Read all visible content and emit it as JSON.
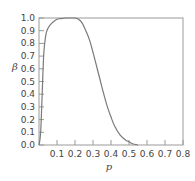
{
  "chart_data": {
    "type": "line",
    "title": "",
    "xlabel": "p",
    "ylabel": "β",
    "xlim": [
      0,
      0.8
    ],
    "ylim": [
      0,
      1.0
    ],
    "xticks": [
      "0.1",
      "0.2",
      "0.3",
      "0.4",
      "0.5",
      "0.6",
      "0.7",
      "0.8"
    ],
    "yticks": [
      "0.0",
      "0.1",
      "0.2",
      "0.3",
      "0.4",
      "0.5",
      "0.6",
      "0.7",
      "0.8",
      "0.9",
      "1.0"
    ],
    "grid": false,
    "legend": null,
    "series": [
      {
        "name": "β(p)",
        "color": "#7a7a7a",
        "x": [
          0.0,
          0.005,
          0.01,
          0.015,
          0.02,
          0.025,
          0.03,
          0.04,
          0.05,
          0.065,
          0.08,
          0.1,
          0.12,
          0.15,
          0.18,
          0.2,
          0.22,
          0.24,
          0.26,
          0.28,
          0.3,
          0.32,
          0.34,
          0.36,
          0.38,
          0.4,
          0.42,
          0.45,
          0.48,
          0.5,
          0.52,
          0.55
        ],
        "values": [
          0.0,
          0.04,
          0.12,
          0.3,
          0.5,
          0.68,
          0.78,
          0.88,
          0.92,
          0.95,
          0.97,
          0.99,
          0.995,
          1.0,
          1.0,
          1.0,
          0.99,
          0.96,
          0.9,
          0.83,
          0.73,
          0.62,
          0.51,
          0.4,
          0.3,
          0.22,
          0.15,
          0.08,
          0.04,
          0.025,
          0.01,
          0.0
        ]
      }
    ]
  }
}
